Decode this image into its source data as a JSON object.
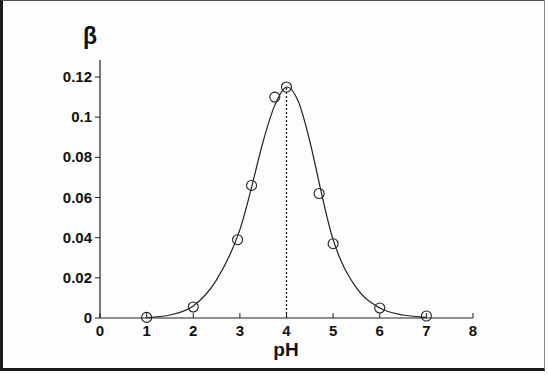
{
  "chart_data": {
    "type": "scatter",
    "title": "",
    "xlabel": "pH",
    "ylabel": "β",
    "xlim": [
      0,
      8
    ],
    "ylim": [
      0,
      0.12
    ],
    "grid": false,
    "legend": null,
    "x_ticks": [
      "0",
      "1",
      "2",
      "3",
      "4",
      "5",
      "6",
      "7",
      "8"
    ],
    "y_ticks": [
      "0",
      "0.02",
      "0.04",
      "0.06",
      "0.08",
      "0.1",
      "0.12"
    ],
    "series": [
      {
        "name": "measured",
        "marker": "open-circle",
        "x": [
          1.0,
          2.0,
          2.95,
          3.25,
          3.75,
          4.0,
          4.7,
          5.0,
          6.0,
          7.0
        ],
        "y": [
          0.0003,
          0.0055,
          0.039,
          0.066,
          0.11,
          0.115,
          0.062,
          0.037,
          0.005,
          0.001
        ]
      },
      {
        "name": "fitted curve",
        "line": "solid",
        "x": [
          1.0,
          1.5,
          2.0,
          2.5,
          3.0,
          3.5,
          3.75,
          4.0,
          4.25,
          4.5,
          5.0,
          5.5,
          6.0,
          6.5,
          7.0
        ],
        "y": [
          0.0002,
          0.0015,
          0.006,
          0.019,
          0.044,
          0.088,
          0.106,
          0.115,
          0.108,
          0.088,
          0.039,
          0.015,
          0.005,
          0.0015,
          0.0003
        ]
      }
    ],
    "annotations": [
      {
        "type": "vertical-dotted-line",
        "x": 4.0,
        "from_y": 0,
        "to_y": 0.115,
        "label": "peak at pH 4"
      }
    ]
  }
}
